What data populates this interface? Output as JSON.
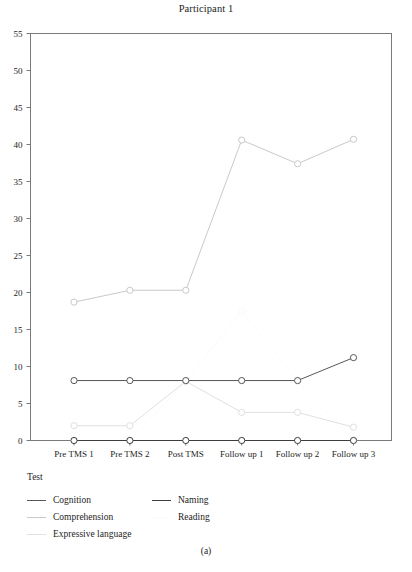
{
  "figure": {
    "caption": "(a)"
  },
  "legend": {
    "title": "Test",
    "left_items": [
      {
        "label": "Cognition",
        "color": "#575757"
      },
      {
        "label": "Comprehension",
        "color": "#c9c9c9"
      },
      {
        "label": "Expressive language",
        "color": "#e0e0e0"
      }
    ],
    "right_items": [
      {
        "label": "Naming",
        "color": "#3d3d3d"
      },
      {
        "label": "Reading",
        "color": "#fbfbfb"
      }
    ]
  },
  "chart_data": {
    "type": "line",
    "title": "Participant 1",
    "xlabel": "",
    "ylabel": "",
    "categories": [
      "Pre TMS 1",
      "Pre TMS 2",
      "Post TMS",
      "Follow up 1",
      "Follow up 2",
      "Follow up 3"
    ],
    "ylim": [
      0,
      55
    ],
    "yticks": [
      0,
      5,
      10,
      15,
      20,
      25,
      30,
      35,
      40,
      45,
      50,
      55
    ],
    "grid": false,
    "legend_position": "below",
    "markers": "open-circle",
    "series": [
      {
        "name": "Cognition",
        "color": "#575757",
        "values": [
          8.1,
          8.1,
          8.1,
          8.1,
          8.1,
          11.2
        ]
      },
      {
        "name": "Comprehension",
        "color": "#c9c9c9",
        "values": [
          18.7,
          20.3,
          20.3,
          40.6,
          37.4,
          40.7
        ]
      },
      {
        "name": "Expressive language",
        "color": "#e0e0e0",
        "values": [
          2.0,
          2.0,
          8.0,
          3.8,
          3.8,
          1.8
        ]
      },
      {
        "name": "Naming",
        "color": "#3d3d3d",
        "values": [
          0.0,
          0.0,
          0.0,
          0.0,
          0.0,
          0.0
        ]
      },
      {
        "name": "Reading",
        "color": "#fbfbfb",
        "values": [
          0.0,
          0.0,
          8.0,
          17.5,
          8.0,
          0.0
        ]
      }
    ]
  }
}
